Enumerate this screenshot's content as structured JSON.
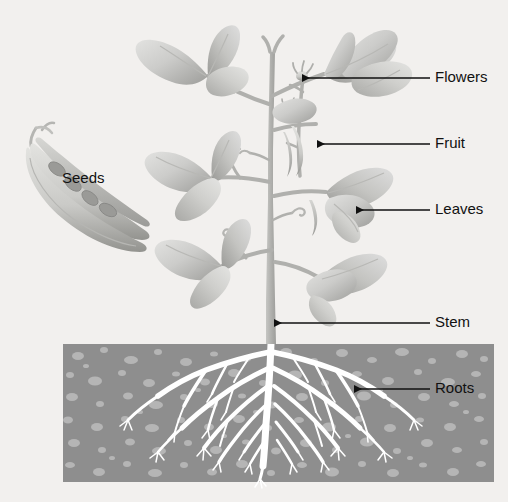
{
  "figure": {
    "background_color": "#f2f0ee",
    "style": "grayscale botanical illustration"
  },
  "palette": {
    "background": "#f2f0ee",
    "soil_fill": "#8e8e8e",
    "soil_speckle": "#b5b5b5",
    "root_color": "#ffffff",
    "stem_color": "#b0b0ae",
    "leaf_light": "#dcdcda",
    "leaf_mid": "#c2c2bf",
    "leaf_dark": "#a3a3a0",
    "pod_light": "#d9d9d6",
    "pod_dark": "#9e9e9b",
    "seed_color": "#9a9a97",
    "label_color": "#111111",
    "leader_color": "#111111"
  },
  "labels": [
    {
      "id": "flowers",
      "text": "Flowers",
      "text_x": 435,
      "text_y": 85,
      "line_x1": 430,
      "line_x2": 302,
      "line_y": 78,
      "arrow_dir": "left",
      "target": "flower bud at top of flowering stalk"
    },
    {
      "id": "fruit",
      "text": "Fruit",
      "text_x": 435,
      "text_y": 144,
      "line_x1": 430,
      "line_x2": 317,
      "line_y": 144,
      "arrow_dir": "left",
      "target": "young seed pod on stalk"
    },
    {
      "id": "leaves",
      "text": "Leaves",
      "text_x": 435,
      "text_y": 210,
      "line_x1": 430,
      "line_x2": 356,
      "line_y": 210,
      "arrow_dir": "left",
      "target": "heart-shaped leaf"
    },
    {
      "id": "stem",
      "text": "Stem",
      "text_x": 435,
      "text_y": 323,
      "line_x1": 430,
      "line_x2": 274,
      "line_y": 323,
      "arrow_dir": "left",
      "target": "main vertical stem above soil"
    },
    {
      "id": "roots",
      "text": "Roots",
      "text_x": 435,
      "text_y": 389,
      "line_x1": 430,
      "line_x2": 354,
      "line_y": 389,
      "arrow_dir": "left",
      "target": "branching root system underground"
    },
    {
      "id": "seeds",
      "text": "Seeds",
      "text_x": 62,
      "text_y": 179,
      "line_x1": null,
      "line_x2": null,
      "line_y": null,
      "arrow_dir": "none",
      "target": "seeds inside opened pod at left"
    }
  ],
  "soil": {
    "x": 63,
    "y": 344,
    "width": 431,
    "height": 138,
    "speckle_count": 260,
    "description": "rectangular cross-section of soil with pebble speckles"
  },
  "plant": {
    "stem_x": 271,
    "stem_top_y": 36,
    "stem_base_y": 344,
    "leaf_clusters": 6,
    "seed_pods_shown": 2,
    "seeds_visible": 4
  }
}
